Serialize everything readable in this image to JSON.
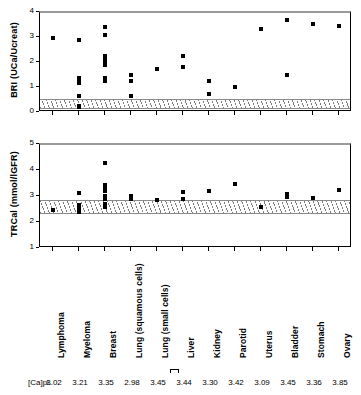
{
  "figure": {
    "capl_label": "[Ca]pl.",
    "categories": [
      "Lymphoma",
      "Myeloma",
      "Breast",
      "Lung (squamous cells)",
      "Lung (small  cells)",
      "Liver",
      "Kidney",
      "Parotid",
      "Uterus",
      "Bladder",
      "Stomach",
      "Ovary"
    ],
    "capl_values": [
      "3.02",
      "3.21",
      "3.35",
      "2.98",
      "3.45",
      "3.44",
      "3.30",
      "3.42",
      "3.09",
      "3.45",
      "3.36",
      "3.85"
    ]
  },
  "chart_data": [
    {
      "type": "scatter",
      "id": "bri-panel",
      "title": "",
      "xlabel": "",
      "ylabel": "BRI (UCa/Ucreat)",
      "ylim": [
        0,
        4
      ],
      "yticks": [
        0,
        1,
        2,
        3,
        4
      ],
      "grid": false,
      "legend": "none",
      "reference_band": {
        "low": 0.15,
        "high": 0.55,
        "style": "hatched"
      },
      "categories": [
        "Lymphoma",
        "Myeloma",
        "Breast",
        "Lung (squamous cells)",
        "Lung (small  cells)",
        "Liver",
        "Kidney",
        "Parotid",
        "Uterus",
        "Bladder",
        "Stomach",
        "Ovary"
      ],
      "series": [
        {
          "name": "Lymphoma",
          "values": [
            3.01
          ]
        },
        {
          "name": "Myeloma",
          "values": [
            2.94,
            1.42,
            1.38,
            1.35,
            1.22,
            0.67,
            0.29,
            0.25
          ]
        },
        {
          "name": "Breast",
          "values": [
            3.45,
            3.12,
            2.3,
            2.18,
            2.05,
            1.93,
            1.4,
            1.33,
            1.28,
            1.27
          ]
        },
        {
          "name": "Lung (squamous cells)",
          "values": [
            1.52,
            1.27,
            0.69
          ]
        },
        {
          "name": "Lung (small  cells)",
          "values": [
            1.76
          ]
        },
        {
          "name": "Liver",
          "values": [
            2.3,
            1.84
          ]
        },
        {
          "name": "Kidney",
          "values": [
            1.29,
            0.76
          ]
        },
        {
          "name": "Parotid",
          "values": [
            1.04
          ]
        },
        {
          "name": "Uterus",
          "values": [
            3.36
          ]
        },
        {
          "name": "Bladder",
          "values": [
            3.72,
            1.52
          ]
        },
        {
          "name": "Stomach",
          "values": [
            3.55
          ]
        },
        {
          "name": "Ovary",
          "values": [
            3.5
          ]
        }
      ]
    },
    {
      "type": "scatter",
      "id": "trcal-panel",
      "title": "",
      "xlabel": "",
      "ylabel": "TRCal  (mmol/lGFR)",
      "ylim": [
        1,
        5
      ],
      "yticks": [
        1,
        2,
        3,
        4,
        5
      ],
      "grid": false,
      "legend": "none",
      "reference_band": {
        "low": 2.35,
        "high": 2.9,
        "style": "hatched"
      },
      "categories": [
        "Lymphoma",
        "Myeloma",
        "Breast",
        "Lung (squamous cells)",
        "Lung (small  cells)",
        "Liver",
        "Kidney",
        "Parotid",
        "Uterus",
        "Bladder",
        "Stomach",
        "Ovary"
      ],
      "series": [
        {
          "name": "Lymphoma",
          "values": [
            2.51
          ]
        },
        {
          "name": "Myeloma",
          "values": [
            3.14,
            2.7,
            2.66,
            2.6,
            2.47,
            2.44
          ]
        },
        {
          "name": "Breast",
          "values": [
            4.32,
            3.46,
            3.35,
            3.22,
            3.05,
            2.92,
            2.74,
            2.62,
            2.6
          ]
        },
        {
          "name": "Lung (squamous cells)",
          "values": [
            3.03,
            2.97,
            2.93
          ]
        },
        {
          "name": "Lung (small  cells)",
          "values": [
            2.88
          ]
        },
        {
          "name": "Liver",
          "values": [
            3.19,
            2.93
          ]
        },
        {
          "name": "Kidney",
          "values": [
            3.24
          ]
        },
        {
          "name": "Parotid",
          "values": [
            3.5
          ]
        },
        {
          "name": "Uterus",
          "values": [
            2.6
          ]
        },
        {
          "name": "Bladder",
          "values": [
            3.12,
            3.0
          ]
        },
        {
          "name": "Stomach",
          "values": [
            2.96
          ]
        },
        {
          "name": "Ovary",
          "values": [
            3.26
          ]
        }
      ]
    }
  ]
}
